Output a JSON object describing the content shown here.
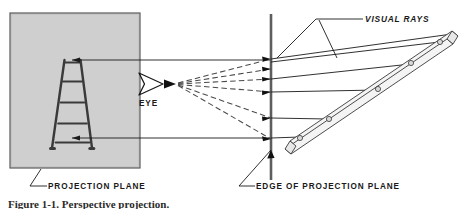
{
  "figure": {
    "kind": "perspective-projection-diagram",
    "caption": "Figure 1-1. Perspective projection.",
    "labels": {
      "eye": "EYE",
      "visual_rays": "VISUAL RAYS",
      "projection_plane": "PROJECTION PLANE",
      "edge_of_projection_plane": "EDGE OF PROJECTION PLANE"
    },
    "colors": {
      "plane_fill": "#cfcfcf",
      "plane_stroke": "#555555",
      "line": "#1a1a1a",
      "dashed_ray": "#4a4a4a",
      "object_fill": "#f2f2f2",
      "object_stroke": "#333333",
      "background": "#ffffff"
    },
    "elements": {
      "projection_plane_rect": {
        "x": 10,
        "y": 13,
        "width": 130,
        "height": 155
      },
      "plane_edge_line": {
        "x": 271,
        "y_top": 14,
        "y_bottom": 180
      },
      "eye_position": {
        "x": 151,
        "y": 84
      },
      "projected_ladder_rungs": 5,
      "visual_ray_count": 6,
      "object_ladder_rungs": 5,
      "projector_line_count": 2
    }
  }
}
